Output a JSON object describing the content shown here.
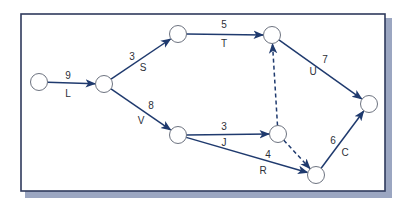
{
  "diagram": {
    "type": "activity-on-arrow network",
    "colors": {
      "line": "#1f3a6e",
      "frame": "#2f3a5c",
      "shadow": "#8a97b6",
      "node_stroke": "#6d7380",
      "label": "#2c2f38"
    },
    "frame": {
      "x": 21,
      "y": 14,
      "w": 364,
      "h": 177
    },
    "nodes": [
      {
        "id": "n1",
        "x": 39,
        "y": 82
      },
      {
        "id": "n2",
        "x": 104,
        "y": 84
      },
      {
        "id": "n3",
        "x": 178,
        "y": 34
      },
      {
        "id": "n4",
        "x": 272,
        "y": 35
      },
      {
        "id": "n5",
        "x": 178,
        "y": 135
      },
      {
        "id": "n6",
        "x": 278,
        "y": 134
      },
      {
        "id": "n7",
        "x": 316,
        "y": 175
      },
      {
        "id": "n8",
        "x": 369,
        "y": 104
      }
    ],
    "edges": [
      {
        "id": "L",
        "from": "n1",
        "to": "n2",
        "activity": "L",
        "duration": "9",
        "dummy": false,
        "dur_pos": [
          68,
          76
        ],
        "act_pos": [
          68,
          94
        ]
      },
      {
        "id": "S",
        "from": "n2",
        "to": "n3",
        "activity": "S",
        "duration": "3",
        "dummy": false,
        "dur_pos": [
          132,
          57
        ],
        "act_pos": [
          143,
          68
        ]
      },
      {
        "id": "T",
        "from": "n3",
        "to": "n4",
        "activity": "T",
        "duration": "5",
        "dummy": false,
        "dur_pos": [
          224,
          25
        ],
        "act_pos": [
          224,
          44
        ]
      },
      {
        "id": "U",
        "from": "n4",
        "to": "n8",
        "activity": "U",
        "duration": "7",
        "dummy": false,
        "dur_pos": [
          325,
          60
        ],
        "act_pos": [
          313,
          72
        ]
      },
      {
        "id": "V",
        "from": "n2",
        "to": "n5",
        "activity": "V",
        "duration": "8",
        "dummy": false,
        "dur_pos": [
          151,
          106
        ],
        "act_pos": [
          141,
          121
        ]
      },
      {
        "id": "J",
        "from": "n5",
        "to": "n6",
        "activity": "J",
        "duration": "3",
        "dummy": false,
        "dur_pos": [
          224,
          127
        ],
        "act_pos": [
          224,
          143
        ]
      },
      {
        "id": "R",
        "from": "n5",
        "to": "n7",
        "activity": "R",
        "duration": "4",
        "dummy": false,
        "dur_pos": [
          268,
          155
        ],
        "act_pos": [
          263,
          171
        ]
      },
      {
        "id": "C",
        "from": "n7",
        "to": "n8",
        "activity": "C",
        "duration": "6",
        "dummy": false,
        "dur_pos": [
          333,
          141
        ],
        "act_pos": [
          345,
          153
        ]
      },
      {
        "id": "D1",
        "from": "n6",
        "to": "n4",
        "activity": "",
        "duration": "",
        "dummy": true
      },
      {
        "id": "D2",
        "from": "n6",
        "to": "n7",
        "activity": "",
        "duration": "",
        "dummy": true
      }
    ],
    "labels": {
      "L": {
        "duration": "9",
        "activity": "L"
      },
      "S": {
        "duration": "3",
        "activity": "S"
      },
      "T": {
        "duration": "5",
        "activity": "T"
      },
      "U": {
        "duration": "7",
        "activity": "U"
      },
      "V": {
        "duration": "8",
        "activity": "V"
      },
      "J": {
        "duration": "3",
        "activity": "J"
      },
      "R": {
        "duration": "4",
        "activity": "R"
      },
      "C": {
        "duration": "6",
        "activity": "C"
      }
    }
  }
}
